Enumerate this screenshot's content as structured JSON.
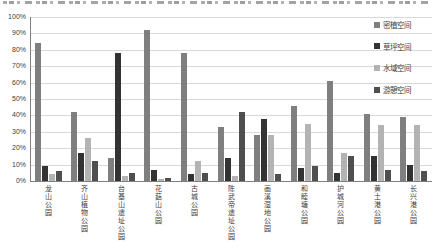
{
  "page": {
    "background": "#ffffff"
  },
  "chart_data": {
    "type": "bar",
    "title": "",
    "xlabel": "",
    "ylabel": "",
    "categories": [
      "龙山公园",
      "齐山植物公园",
      "台基山遗址公园",
      "花菇山公园",
      "古城公园",
      "陈武帝遗址公园",
      "画溪湿地公园",
      "和睦塘公园",
      "护城河公园",
      "黄土港公园",
      "长兴港公园"
    ],
    "series": [
      {
        "name": "密植空间",
        "color": "#7f7f7f",
        "values": [
          84,
          42,
          14,
          92,
          78,
          33,
          28,
          46,
          61,
          41,
          39
        ]
      },
      {
        "name": "草坪空间",
        "color": "#333333",
        "values": [
          9,
          17,
          78,
          7,
          4,
          14,
          38,
          8,
          5,
          15,
          10
        ]
      },
      {
        "name": "水域空间",
        "color": "#b3b3b3",
        "values": [
          4,
          26,
          3,
          1,
          12,
          3,
          28,
          35,
          17,
          34,
          34
        ]
      },
      {
        "name": "游憩空间",
        "color": "#4f4f4f",
        "values": [
          6,
          12,
          5,
          2,
          5,
          42,
          4,
          9,
          15,
          7,
          6
        ]
      }
    ],
    "ylim": [
      0,
      100
    ],
    "y_ticks": [
      "100%",
      "90%",
      "80%",
      "70%",
      "60%",
      "50%",
      "40%",
      "30%",
      "20%",
      "10%",
      "0%"
    ],
    "grid": true,
    "legend_position": "top-right-overlay",
    "axis_color": "#808080",
    "gridline_color": "#d9d9d9",
    "tick_label_color": "#404040"
  }
}
